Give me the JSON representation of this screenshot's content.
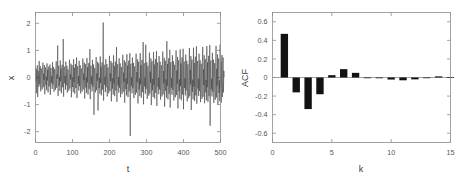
{
  "figure": {
    "background": "#ffffff",
    "width": 469,
    "height": 180,
    "panels": [
      "timeseries",
      "acf"
    ]
  },
  "chart_data": [
    {
      "id": "timeseries",
      "type": "line",
      "title": "",
      "xlabel": "t",
      "ylabel": "x",
      "xlim": [
        0,
        500
      ],
      "ylim": [
        -2.4,
        2.4
      ],
      "xticks": [
        0,
        100,
        200,
        300,
        400,
        500
      ],
      "xticklabels": [
        "0",
        "100",
        "200",
        "300",
        "400",
        "500"
      ],
      "yticks": [
        -2,
        -1,
        0,
        1,
        2
      ],
      "yticklabels": [
        "-2",
        "-1",
        "0",
        "1",
        "2"
      ],
      "grid": false,
      "legend": null,
      "line_color": "#3b3b3b",
      "series": [
        {
          "name": "x",
          "x_start": 0,
          "x_step": 1,
          "n": 501,
          "values": [
            0.38,
            -0.15,
            0.32,
            -0.58,
            0.12,
            0.45,
            -0.72,
            0.24,
            0.05,
            -0.34,
            0.61,
            -0.25,
            0.18,
            0.42,
            -0.51,
            0.08,
            0.33,
            -0.18,
            -0.44,
            0.27,
            0.55,
            -0.36,
            0.14,
            -0.09,
            0.46,
            -0.62,
            0.21,
            0.37,
            -0.28,
            0.03,
            -0.47,
            0.52,
            -0.11,
            0.29,
            -0.55,
            0.16,
            0.41,
            -0.33,
            -0.07,
            0.48,
            -0.64,
            0.22,
            0.35,
            -0.19,
            0.06,
            -0.42,
            0.57,
            -0.26,
            0.13,
            0.39,
            -0.53,
            0.09,
            0.31,
            -0.17,
            -0.46,
            0.25,
            0.6,
            -0.38,
            0.11,
            -0.05,
            1.18,
            -0.68,
            0.26,
            0.44,
            -0.31,
            0.02,
            -0.5,
            0.63,
            -0.14,
            0.34,
            -0.58,
            0.19,
            0.47,
            -0.36,
            -0.04,
            1.42,
            -0.71,
            0.23,
            0.4,
            -0.21,
            0.07,
            -0.45,
            0.59,
            -0.29,
            0.15,
            0.43,
            -0.56,
            0.1,
            0.3,
            -0.2,
            -0.49,
            0.28,
            0.66,
            -0.41,
            0.12,
            -0.08,
            0.51,
            -0.73,
            0.24,
            0.46,
            -0.35,
            0.01,
            -0.54,
            0.68,
            -0.16,
            0.36,
            -0.6,
            0.2,
            0.5,
            -0.39,
            -0.02,
            0.74,
            -0.76,
            0.27,
            0.42,
            -0.23,
            0.05,
            -0.48,
            0.62,
            -0.32,
            0.17,
            0.45,
            -0.59,
            0.08,
            0.33,
            -0.22,
            -0.52,
            0.3,
            0.7,
            -0.44,
            0.14,
            -0.1,
            0.55,
            -0.78,
            0.26,
            0.49,
            -0.37,
            0.0,
            -0.57,
            0.72,
            -0.18,
            0.38,
            -0.63,
            0.21,
            0.53,
            -0.42,
            -0.03,
            1.05,
            -0.8,
            0.29,
            0.44,
            -0.25,
            0.04,
            -0.51,
            0.65,
            -0.34,
            0.19,
            0.48,
            -1.38,
            0.06,
            0.35,
            -0.24,
            -0.55,
            0.32,
            0.75,
            -0.47,
            0.15,
            -0.12,
            0.58,
            -1.22,
            0.28,
            0.52,
            -0.39,
            -0.01,
            -0.6,
            0.78,
            -0.2,
            0.4,
            -0.66,
            0.22,
            0.56,
            -0.45,
            -0.05,
            2.03,
            -0.85,
            0.31,
            0.47,
            -0.27,
            0.03,
            -0.54,
            0.68,
            -0.36,
            0.21,
            0.5,
            -0.7,
            0.05,
            0.37,
            -0.26,
            -0.58,
            0.34,
            0.8,
            -0.5,
            0.16,
            -0.14,
            0.61,
            -0.88,
            0.3,
            0.54,
            -0.41,
            -0.02,
            -0.63,
            0.82,
            -0.22,
            0.42,
            -0.69,
            0.24,
            0.59,
            -0.48,
            -0.06,
            1.12,
            -0.9,
            0.33,
            0.49,
            -0.29,
            0.02,
            -0.56,
            0.71,
            -0.38,
            0.23,
            0.52,
            -0.73,
            0.04,
            0.39,
            -0.28,
            -0.61,
            0.36,
            0.84,
            -0.53,
            0.18,
            -0.16,
            0.64,
            -0.93,
            0.32,
            0.56,
            -0.43,
            -0.03,
            -0.66,
            0.86,
            -0.24,
            0.44,
            -0.72,
            0.26,
            0.62,
            -0.51,
            -0.08,
            0.9,
            -2.16,
            0.35,
            0.51,
            -0.31,
            0.01,
            -0.58,
            0.74,
            -0.4,
            0.25,
            0.54,
            -0.76,
            0.03,
            0.41,
            -0.3,
            -0.64,
            0.38,
            0.88,
            -0.56,
            0.2,
            -0.18,
            0.67,
            -0.96,
            0.34,
            0.58,
            -0.45,
            -0.04,
            -0.69,
            0.9,
            -0.26,
            0.46,
            -0.75,
            0.28,
            0.65,
            -0.54,
            -0.09,
            1.31,
            -0.99,
            0.37,
            0.53,
            -0.33,
            0.0,
            -0.6,
            1.21,
            -0.42,
            0.27,
            0.56,
            -0.79,
            0.02,
            0.43,
            -0.32,
            -0.67,
            0.4,
            0.92,
            -0.59,
            0.22,
            -0.2,
            0.7,
            -1.02,
            0.36,
            0.6,
            -0.47,
            -0.05,
            -0.72,
            0.94,
            -0.28,
            0.48,
            -0.78,
            0.3,
            0.68,
            -0.57,
            -0.1,
            0.98,
            -1.05,
            0.39,
            0.55,
            -0.35,
            -0.01,
            -0.62,
            0.79,
            -0.44,
            0.29,
            0.58,
            -0.82,
            0.01,
            0.45,
            -0.34,
            -0.7,
            0.42,
            0.96,
            -0.62,
            0.24,
            -0.22,
            0.73,
            -1.08,
            0.38,
            0.62,
            -0.49,
            -0.06,
            -0.75,
            1.34,
            -0.3,
            0.5,
            -0.81,
            0.32,
            0.71,
            -0.6,
            -0.11,
            1.02,
            -1.11,
            0.41,
            0.57,
            -0.37,
            -0.02,
            -0.64,
            0.82,
            -0.46,
            0.31,
            0.6,
            -0.85,
            0.0,
            0.47,
            -0.36,
            -0.73,
            0.44,
            1.0,
            -0.65,
            0.26,
            -0.24,
            0.76,
            -1.14,
            0.4,
            0.64,
            -0.51,
            -0.07,
            -0.78,
            1.04,
            -0.32,
            0.52,
            -0.84,
            0.34,
            0.74,
            -0.63,
            -0.12,
            1.06,
            -1.17,
            0.43,
            0.59,
            -0.39,
            -0.03,
            -0.66,
            0.85,
            -0.48,
            0.33,
            0.62,
            -0.88,
            -0.01,
            0.49,
            -0.38,
            -0.76,
            0.46,
            1.09,
            -0.68,
            0.28,
            -0.26,
            0.79,
            -1.2,
            0.42,
            0.66,
            -0.53,
            -0.08,
            -0.81,
            1.1,
            -0.34,
            0.54,
            -0.87,
            0.36,
            0.77,
            -0.66,
            -0.13,
            1.15,
            -0.97,
            0.45,
            0.61,
            -0.41,
            -0.04,
            -0.68,
            0.88,
            -0.5,
            0.35,
            0.64,
            -0.91,
            -0.02,
            0.51,
            -0.4,
            -0.79,
            0.48,
            1.13,
            -0.71,
            0.3,
            -0.28,
            0.82,
            -0.95,
            0.44,
            0.68,
            -0.55,
            -0.09,
            -0.84,
            1.16,
            -0.36,
            0.56,
            -0.9,
            0.38,
            0.8,
            -0.69,
            -0.14,
            1.2,
            -1.78,
            0.47,
            0.63,
            -0.43,
            -0.05,
            -0.7,
            0.91,
            -0.52,
            0.37,
            0.66,
            -0.94,
            -0.03,
            0.53,
            -0.42,
            -0.82,
            0.5,
            1.17,
            -0.74,
            0.32,
            -0.3,
            0.85,
            -0.99,
            0.46,
            0.7,
            -0.57,
            -0.1,
            -0.87,
            1.22,
            -0.38,
            0.58,
            -0.93,
            0.4,
            0.83,
            -0.72,
            -0.15,
            0.74,
            -0.55,
            0.25,
            0.02
          ]
        }
      ]
    },
    {
      "id": "acf",
      "type": "bar",
      "title": "",
      "xlabel": "k",
      "ylabel": "ACF",
      "xlim": [
        0,
        15
      ],
      "ylim": [
        -0.7,
        0.7
      ],
      "xticks": [
        0,
        5,
        10,
        15
      ],
      "xticklabels": [
        "0",
        "5",
        "10",
        "15"
      ],
      "yticks": [
        -0.6,
        -0.4,
        -0.2,
        0,
        0.2,
        0.4,
        0.6
      ],
      "yticklabels": [
        "-0.6",
        "-0.4",
        "-0.2",
        "0",
        "0.2",
        "0.4",
        "0.6"
      ],
      "grid": false,
      "legend": null,
      "bar_color": "#121212",
      "bar_width": 0.62,
      "categories": [
        1,
        2,
        3,
        4,
        5,
        6,
        7,
        8,
        9,
        10,
        11,
        12,
        13,
        14,
        15
      ],
      "values": [
        0.47,
        -0.16,
        -0.34,
        -0.18,
        0.025,
        0.09,
        0.05,
        -0.005,
        -0.008,
        -0.022,
        -0.03,
        -0.02,
        -0.004,
        0.012,
        0.004
      ]
    }
  ]
}
